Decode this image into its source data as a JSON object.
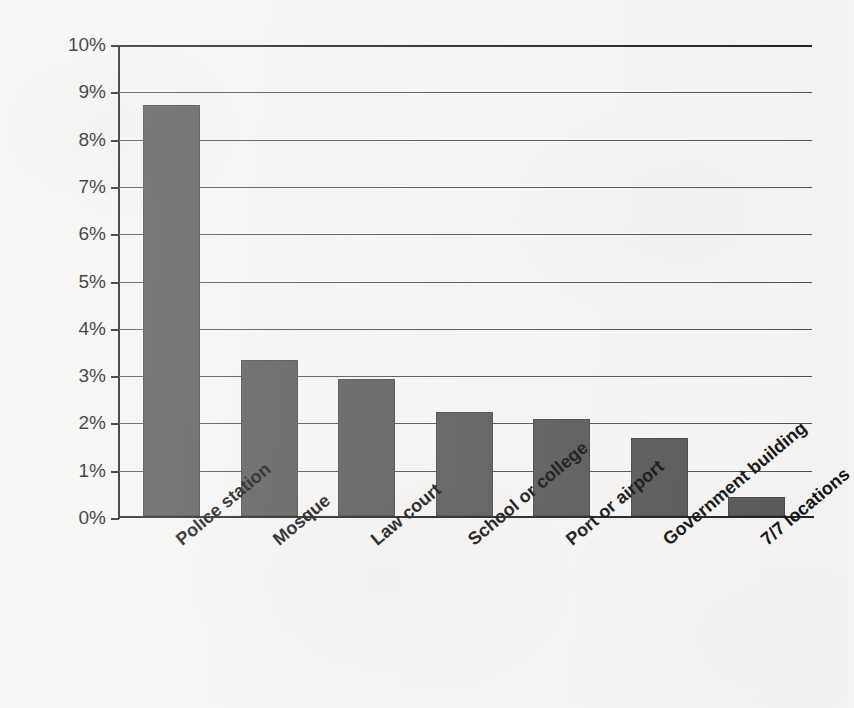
{
  "chart_data": {
    "type": "bar",
    "title": "",
    "subtitle": "",
    "xlabel": "",
    "ylabel": "Percentage of sample",
    "categories": [
      "Police station",
      "Mosque",
      "Law court",
      "School or college",
      "Port or airport",
      "Government building",
      "7/7 locations"
    ],
    "values": [
      8.7,
      3.3,
      2.9,
      2.2,
      2.05,
      1.65,
      0.4
    ],
    "value_labels": [
      "8.7%",
      "3.3%",
      "2.9%",
      "2.2%",
      "2.05%",
      "1.65%",
      "0.4%"
    ],
    "ylim": [
      0,
      10
    ],
    "ytick_values": [
      0,
      1,
      2,
      3,
      4,
      5,
      6,
      7,
      8,
      9,
      10
    ],
    "ytick_labels": [
      "0%",
      "1%",
      "2%",
      "3%",
      "4%",
      "5%",
      "6%",
      "7%",
      "8%",
      "9%",
      "10%"
    ],
    "grid": true,
    "legend": false,
    "legend_position": "none",
    "bar_color": "#575757",
    "axis_color": "#1d1f21",
    "grid_color": "#4c4f52",
    "background_color": "#f6f5f3",
    "xtick_label_rotation": -40
  },
  "axis": {
    "y_title": "Percentage of sample"
  }
}
